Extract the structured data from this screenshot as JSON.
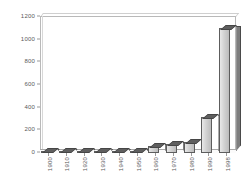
{
  "chart_data": {
    "type": "bar",
    "title": "",
    "subtitle": "",
    "xlabel": "",
    "ylabel": "",
    "categories": [
      "1900",
      "1910",
      "1920",
      "1930",
      "1940",
      "1950",
      "1960",
      "1970",
      "1980",
      "1990",
      "1998"
    ],
    "values": [
      10,
      10,
      12,
      15,
      12,
      18,
      62,
      78,
      100,
      320,
      1100
    ],
    "ylim": [
      0,
      1200
    ],
    "y_ticks": [
      0,
      200,
      400,
      600,
      800,
      1000,
      1200
    ],
    "y_tick_labels": [
      "0",
      "200",
      "400",
      "600",
      "800",
      "1000",
      "1200"
    ],
    "grid": false,
    "legend": null,
    "legend_position": "none",
    "style": "3d-column",
    "colors": {
      "bar_front": "#d2d2d2",
      "bar_side": "#7e7e7e",
      "bar_top": "#5f5f5f",
      "bar_outline": "#5d5d5d",
      "axis_text": "#5a5a5a",
      "frame": "#b9b9b9",
      "background": "#ffffff"
    }
  }
}
